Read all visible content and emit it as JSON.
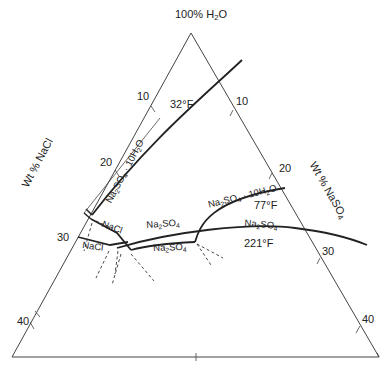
{
  "apex_label": {
    "pre": "100% H",
    "sub": "2",
    "post": "O"
  },
  "left_axis": {
    "label": "Wt % NaCl",
    "ticks": [
      "10",
      "20",
      "30",
      "40"
    ]
  },
  "right_axis": {
    "label_pre": "Wt % NaSO",
    "label_sub": "4",
    "ticks": [
      "10",
      "20",
      "30",
      "40"
    ]
  },
  "isotherms": [
    {
      "temp": "32°F"
    },
    {
      "temp": "77°F"
    },
    {
      "temp": "221°F"
    }
  ],
  "field_labels": {
    "decahydrate_left": {
      "pre": "Na",
      "s1": "2",
      "mid": "SO",
      "s2": "4",
      "post": " · 10H",
      "s3": "2",
      "end": "O"
    },
    "decahydrate_right": {
      "pre": "Na",
      "s1": "2",
      "mid": "SO",
      "s2": "4",
      "post": " · 10H",
      "s3": "2",
      "end": "O"
    },
    "nacl_upper": "NaCl",
    "nacl_lower": "NaCl",
    "na2so4_upper": {
      "pre": "Na",
      "s1": "2",
      "mid": "SO",
      "s2": "4"
    },
    "na2so4_lower": {
      "pre": "Na",
      "s1": "2",
      "mid": "SO",
      "s2": "4"
    },
    "na2so4_right": {
      "pre": "Na",
      "s1": "2",
      "mid": "SO",
      "s2": "4"
    }
  },
  "colors": {
    "line": "#222222",
    "thin": "#444444",
    "background": "#ffffff"
  }
}
